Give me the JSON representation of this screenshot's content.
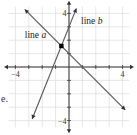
{
  "chart_data": {
    "type": "line",
    "title": "",
    "xlabel": "",
    "ylabel": "",
    "xlim": [
      -4.5,
      4.5
    ],
    "ylim": [
      -4.5,
      4.5
    ],
    "grid": true,
    "x_tick_labels": [
      {
        "value": -4,
        "label": "−4"
      },
      {
        "value": 4,
        "label": "4"
      }
    ],
    "y_tick_labels": [
      {
        "value": 4,
        "label": "4"
      },
      {
        "value": -4,
        "label": "−4"
      }
    ],
    "series": [
      {
        "name": "line a",
        "slope": -1,
        "intercept": 1,
        "x_range": [
          -3.3,
          4.2
        ],
        "label": "line a",
        "label_pos": [
          -3.3,
          2.2
        ]
      },
      {
        "name": "line b",
        "slope": 2.5,
        "intercept": 3,
        "x_range": [
          -2.75,
          0.55
        ],
        "label": "line b",
        "label_pos": [
          0.9,
          3.2
        ]
      }
    ],
    "points": [
      {
        "x": -0.57,
        "y": 1.57,
        "label": "intersection"
      }
    ]
  },
  "side_text": "e.",
  "colors": {
    "line": "#555555",
    "grid": "#dddddd",
    "axis": "#333333",
    "point": "#000000"
  }
}
